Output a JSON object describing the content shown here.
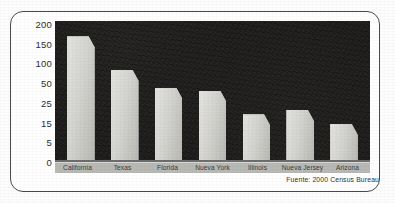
{
  "chart_data": {
    "type": "bar",
    "title": "",
    "xlabel": "",
    "ylabel": "",
    "categories": [
      "California",
      "Texas",
      "Florida",
      "Nueva York",
      "Illinois",
      "Nueva Jersey",
      "Arizona"
    ],
    "values": [
      135,
      74,
      44.1,
      42.8,
      18.8,
      19.7,
      13.1
    ],
    "value_labels": [
      "$135",
      "$74",
      "$44,1",
      "$42,8",
      "$18,8",
      "$19,7",
      "$13,1"
    ],
    "y_ticks": [
      "200",
      "150",
      "100",
      "50",
      "25",
      "15",
      "5",
      "0"
    ],
    "y_tick_values": [
      200,
      150,
      100,
      50,
      25,
      15,
      5,
      0
    ],
    "ylim": [
      0,
      200
    ],
    "axis_scale": "piecewise-linear (ticks evenly spaced: 200,150,100,50,25,15,5,0)",
    "grid": false,
    "legend": "none",
    "source_note": "Fuente: 2000 Census Bureau",
    "bar_fill_color": "#cdcdc9",
    "plot_background_color": "#1d1c1b",
    "label_band_color": "#b8b8b4",
    "label_text_color": "#f2f2ef",
    "bar_pixel_heights_pct": [
      89,
      65,
      52,
      50,
      33,
      36,
      26
    ]
  }
}
